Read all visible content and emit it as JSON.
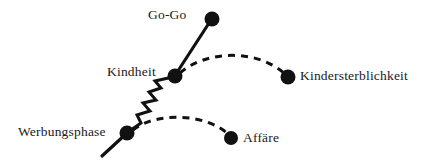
{
  "diagram": {
    "type": "node-link-diagram",
    "background_color": "#ffffff",
    "ink_color": "#111111",
    "width": 426,
    "height": 163,
    "nodes": [
      {
        "id": "go-go",
        "label": "Go-Go",
        "x": 212,
        "y": 19,
        "radius": 7.5,
        "label_position": "left"
      },
      {
        "id": "kindheit",
        "label": "Kindheit",
        "x": 175,
        "y": 76,
        "radius": 7.5,
        "label_position": "left"
      },
      {
        "id": "kindersterblichkeit",
        "label": "Kindersterblichkeit",
        "x": 288,
        "y": 77,
        "radius": 7.5,
        "label_position": "right"
      },
      {
        "id": "werbungsphase",
        "label": "Werbungsphase",
        "x": 127,
        "y": 133,
        "radius": 7.5,
        "label_position": "left"
      },
      {
        "id": "affaere",
        "label": "Affäre",
        "x": 231,
        "y": 138,
        "radius": 7.0,
        "label_position": "right"
      }
    ],
    "edges": [
      {
        "id": "kindheit-gogo",
        "from": "kindheit",
        "to": "go-go",
        "style": "solid"
      },
      {
        "id": "werbungsphase-kindheit",
        "from": "werbungsphase",
        "to": "kindheit",
        "style": "zigzag"
      },
      {
        "id": "kindheit-kindersterblichkeit",
        "from": "kindheit",
        "to": "kindersterblichkeit",
        "style": "dashed-arc"
      },
      {
        "id": "werbungsphase-affaere",
        "from": "werbungsphase",
        "to": "affaere",
        "style": "dashed-arc"
      },
      {
        "id": "werbungsphase-tail",
        "from": "werbungsphase",
        "to": "tail-end",
        "style": "solid"
      }
    ],
    "labels": {
      "go_go": "Go-Go",
      "kindheit": "Kindheit",
      "kindersterblichkeit": "Kindersterblichkeit",
      "werbungsphase": "Werbungsphase",
      "affaere": "Affäre"
    }
  }
}
